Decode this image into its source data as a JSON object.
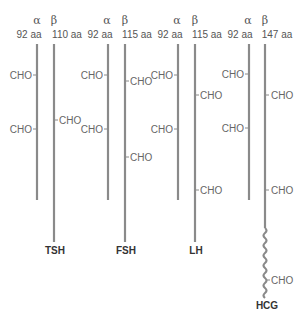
{
  "diagram": {
    "chain_color": "#8a8a8a",
    "hormones": [
      {
        "name": "TSH",
        "alpha": {
          "symbol": "α",
          "length_label": "92 aa",
          "cho_sites": [
            "CHO",
            "CHO"
          ]
        },
        "beta": {
          "symbol": "β",
          "length_label": "110 aa",
          "cho_sites": [
            "CHO"
          ]
        }
      },
      {
        "name": "FSH",
        "alpha": {
          "symbol": "α",
          "length_label": "92 aa",
          "cho_sites": [
            "CHO",
            "CHO"
          ]
        },
        "beta": {
          "symbol": "β",
          "length_label": "115 aa",
          "cho_sites": [
            "CHO",
            "CHO"
          ]
        }
      },
      {
        "name": "LH",
        "alpha": {
          "symbol": "α",
          "length_label": "92 aa",
          "cho_sites": [
            "CHO",
            "CHO"
          ]
        },
        "beta": {
          "symbol": "β",
          "length_label": "115 aa",
          "cho_sites": [
            "CHO",
            "CHO"
          ]
        }
      },
      {
        "name": "HCG",
        "alpha": {
          "symbol": "α",
          "length_label": "92 aa",
          "cho_sites": [
            "CHO",
            "CHO"
          ]
        },
        "beta": {
          "symbol": "β",
          "length_label": "147 aa",
          "cho_sites": [
            "CHO",
            "CHO",
            "CHO"
          ],
          "c_terminal_extension": "wavy"
        }
      }
    ]
  }
}
